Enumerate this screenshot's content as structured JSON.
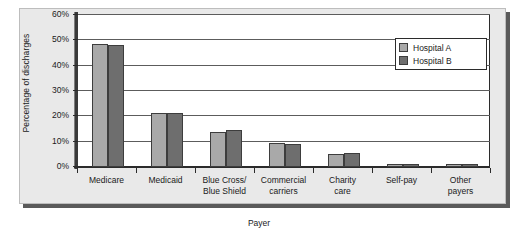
{
  "chart_data": {
    "type": "bar",
    "title": "",
    "xlabel": "Payer",
    "ylabel": "Percentage of discharges",
    "ylim": [
      0,
      60
    ],
    "ytick_labels": [
      "0%",
      "10%",
      "20%",
      "30%",
      "40%",
      "50%",
      "60%"
    ],
    "ytick_values": [
      0,
      10,
      20,
      30,
      40,
      50,
      60
    ],
    "grid": true,
    "legend_position": "top-right",
    "categories": [
      "Medicare",
      "Medicaid",
      "Blue Cross/ Blue Shield",
      "Commercial carriers",
      "Charity care",
      "Self-pay",
      "Other payers"
    ],
    "category_lines": [
      [
        "Medicare"
      ],
      [
        "Medicaid"
      ],
      [
        "Blue Cross/",
        "Blue Shield"
      ],
      [
        "Commercial",
        "carriers"
      ],
      [
        "Charity",
        "care"
      ],
      [
        "Self-pay"
      ],
      [
        "Other",
        "payers"
      ]
    ],
    "series": [
      {
        "name": "Hospital A",
        "color": "#a9a9a9",
        "values": [
          48.5,
          21.5,
          14.0,
          9.5,
          5.0,
          1.0,
          1.0
        ]
      },
      {
        "name": "Hospital B",
        "color": "#6e6e6e",
        "values": [
          48.0,
          21.5,
          14.5,
          9.0,
          5.5,
          1.0,
          1.0
        ]
      }
    ]
  },
  "legend": {
    "items": [
      {
        "label": "Hospital A",
        "swatch": "a"
      },
      {
        "label": "Hospital B",
        "swatch": "b"
      }
    ]
  },
  "colors": {
    "series_a": "#a9a9a9",
    "series_b": "#6e6e6e",
    "panel": "#e9e9e9",
    "plot_background": "#ffffff",
    "axis": "#2b2b2b"
  }
}
